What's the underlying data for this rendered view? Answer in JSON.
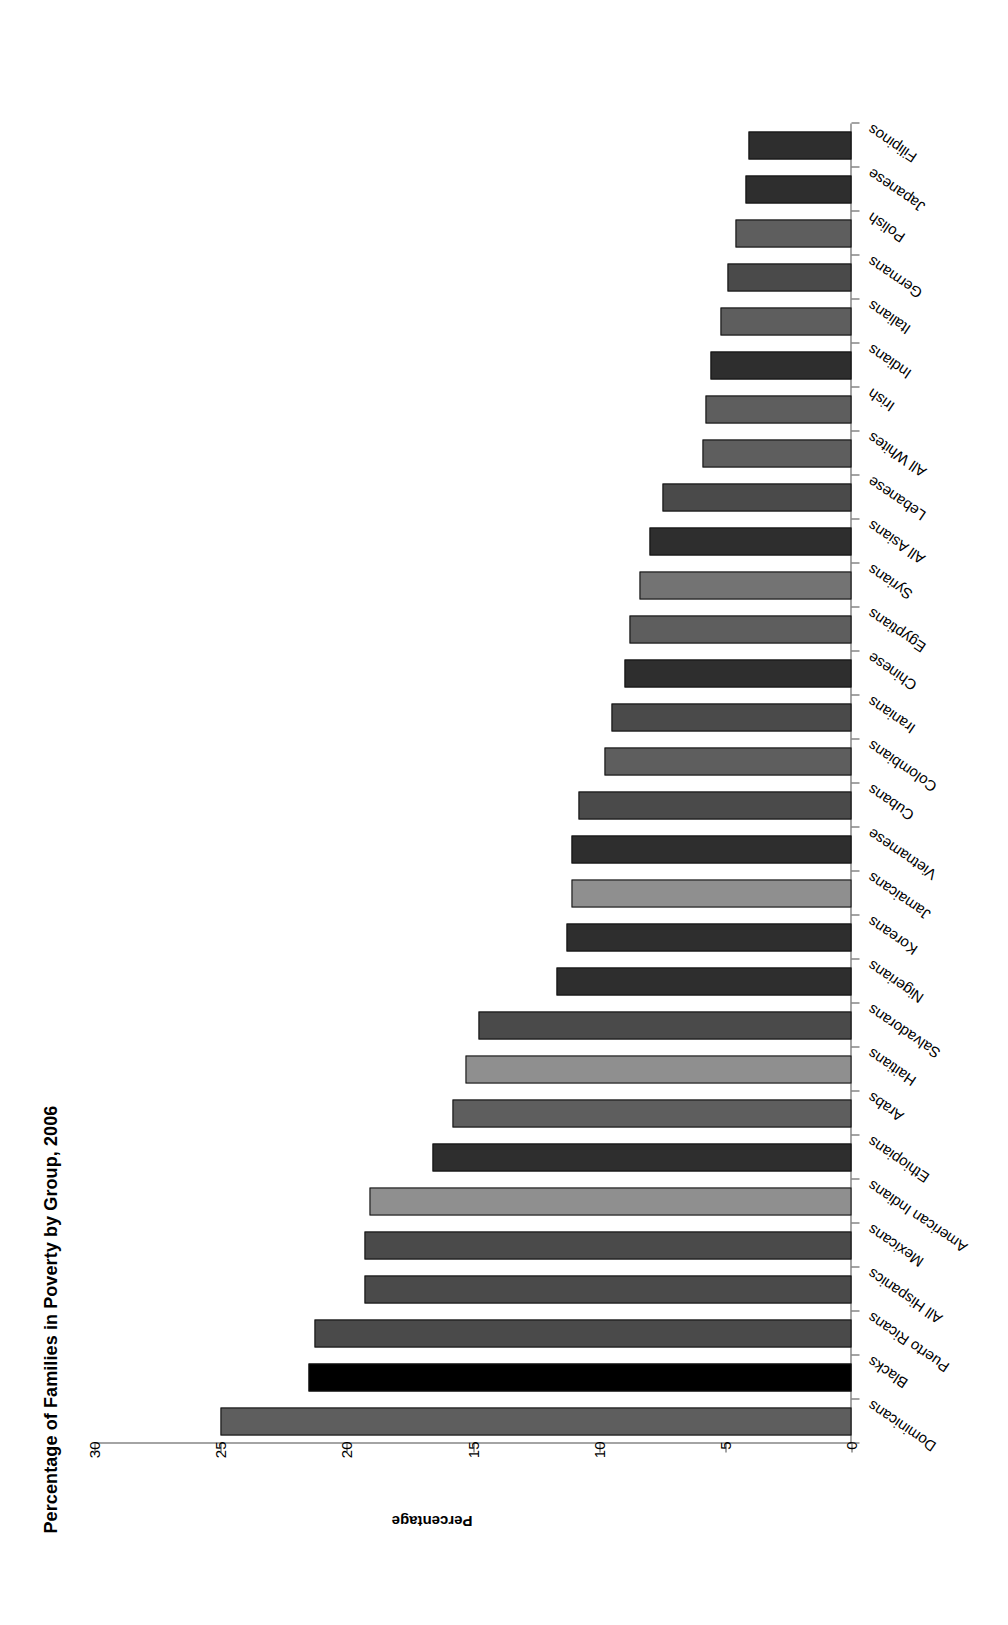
{
  "chart_data": {
    "type": "bar",
    "title": "Percentage of Families in Poverty by Group, 2006",
    "xlabel": "",
    "ylabel": "Percentage",
    "ylim": [
      0,
      30
    ],
    "yticks": [
      0,
      5,
      10,
      15,
      20,
      25,
      30
    ],
    "grid": false,
    "legend": "none",
    "orientation": "horizontal-rotated",
    "categories": [
      "Dominicans",
      "Blacks",
      "Puerto Ricans",
      "All Hispanics",
      "Mexicans",
      "American Indians",
      "Ethiopians",
      "Arabs",
      "Haitians",
      "Salvadorans",
      "Nigerians",
      "Koreans",
      "Jamaicans",
      "Vietnamese",
      "Cubans",
      "Colombians",
      "Iranians",
      "Chinese",
      "Egyptians",
      "Syrians",
      "All Asians",
      "Lebanese",
      "All Whites",
      "Irish",
      "Indians",
      "Italians",
      "Germans",
      "Polish",
      "Japanese",
      "Filipinos"
    ],
    "values": [
      25.0,
      21.5,
      21.3,
      19.3,
      19.3,
      19.1,
      16.6,
      15.8,
      15.3,
      14.8,
      11.7,
      11.3,
      11.1,
      11.1,
      10.8,
      9.8,
      9.5,
      9.0,
      8.8,
      8.4,
      8.0,
      7.5,
      5.9,
      5.8,
      5.6,
      5.2,
      4.9,
      4.6,
      4.2,
      4.1
    ],
    "bar_styles": [
      "medium",
      "black",
      "medium-dark",
      "hatched",
      "medium-dark",
      "light",
      "dark",
      "medium",
      "light",
      "medium-dark",
      "dark",
      "dark",
      "light",
      "dark",
      "medium-dark",
      "medium",
      "medium-dark",
      "dark",
      "medium",
      "medium-light",
      "hatched-dark",
      "medium-dark",
      "hatched-light",
      "medium",
      "dark",
      "medium",
      "medium-dark",
      "medium",
      "dark",
      "dark"
    ],
    "colors": {
      "black": "#000000",
      "dark": "#2e2e2e",
      "medium-dark": "#4a4a4a",
      "medium": "#5e5e5e",
      "medium-light": "#737373",
      "light": "#8f8f8f",
      "axis": "#4a4a4a",
      "text": "#000000",
      "background": "#ffffff"
    }
  }
}
